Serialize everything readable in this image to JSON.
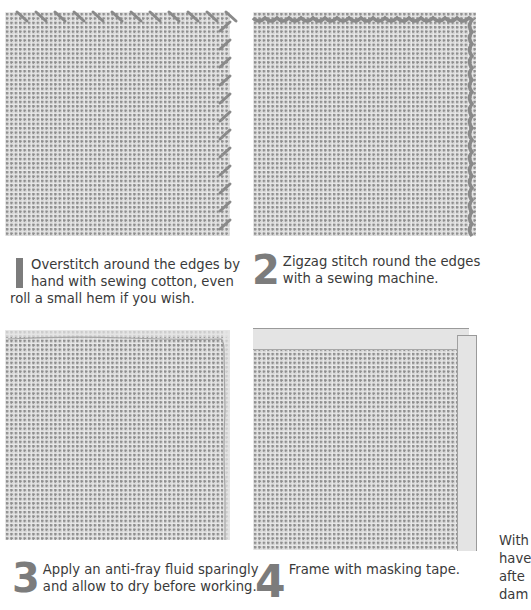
{
  "steps": [
    {
      "number": "1",
      "text": "Overstitch around the edges by hand with sewing cotton, even roll a small hem if you wish.",
      "illustration": "overstitched-canvas"
    },
    {
      "number": "2",
      "text": "Zigzag stitch round the edges with a sewing machine.",
      "illustration": "zigzag-stitched-canvas"
    },
    {
      "number": "3",
      "text": "Apply an anti-fray fluid sparingly and allow to dry before working.",
      "illustration": "anti-fray-canvas"
    },
    {
      "number": "4",
      "text": "Frame with masking tape.",
      "illustration": "masking-tape-canvas"
    }
  ],
  "side_text_lines": [
    "With",
    "have",
    "afte",
    "dam"
  ],
  "colors": {
    "canvas": "#d7d7d7",
    "stitch": "#8a8a8a",
    "numeral": "#7c7c7c",
    "tape": "#e4e4e4"
  }
}
